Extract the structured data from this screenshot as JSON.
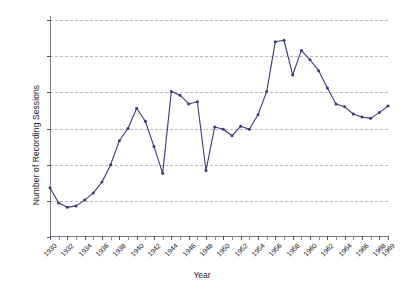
{
  "chart_data": {
    "type": "line",
    "title": "",
    "xlabel": "Year",
    "ylabel": "Number of Recording Sessions",
    "xlim": [
      1930,
      1969
    ],
    "ylim": [
      0,
      3000
    ],
    "grid": true,
    "legend": false,
    "line_color": "#3a3a7d",
    "marker": "circle",
    "yticks": [
      0,
      500,
      1000,
      1500,
      2000,
      2500,
      3000
    ],
    "ytick_labels": [
      "0",
      "500",
      "1000",
      "1500",
      "2000",
      "2500",
      "3000"
    ],
    "xticks": [
      1930,
      1932,
      1934,
      1936,
      1938,
      1940,
      1942,
      1944,
      1946,
      1948,
      1950,
      1952,
      1954,
      1956,
      1958,
      1960,
      1962,
      1964,
      1966,
      1968,
      1969
    ],
    "xtick_labels": [
      "1930",
      "1932",
      "1934",
      "1936",
      "1938",
      "1940",
      "1942",
      "1944",
      "1946",
      "1948",
      "1950",
      "1952",
      "1954",
      "1956",
      "1958",
      "1960",
      "1962",
      "1964",
      "1966",
      "1968",
      "1969"
    ],
    "x": [
      1930,
      1931,
      1932,
      1933,
      1934,
      1935,
      1936,
      1937,
      1938,
      1939,
      1940,
      1941,
      1942,
      1943,
      1944,
      1945,
      1946,
      1947,
      1948,
      1949,
      1950,
      1951,
      1952,
      1953,
      1954,
      1955,
      1956,
      1957,
      1958,
      1959,
      1960,
      1961,
      1962,
      1963,
      1964,
      1965,
      1966,
      1967,
      1968,
      1969
    ],
    "values": [
      680,
      470,
      410,
      430,
      510,
      610,
      760,
      1000,
      1330,
      1500,
      1780,
      1600,
      1250,
      880,
      2010,
      1960,
      1840,
      1870,
      920,
      1520,
      1490,
      1400,
      1530,
      1490,
      1690,
      2010,
      2700,
      2720,
      2240,
      2580,
      2450,
      2300,
      2060,
      1840,
      1800,
      1700,
      1660,
      1640,
      1720,
      1810
    ]
  },
  "axis": {
    "ylabel": "Number of Recording Sessions",
    "xlabel": "Year"
  }
}
